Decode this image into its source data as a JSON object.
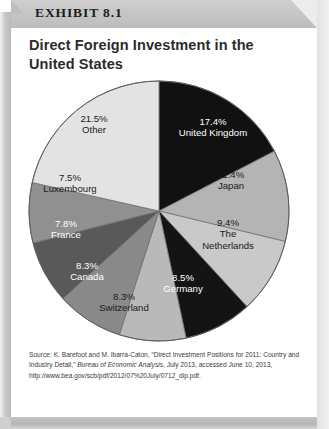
{
  "exhibit": {
    "label": "EXHIBIT 8.1"
  },
  "title": "Direct Foreign Investment in the United States",
  "source": {
    "prefix": "Source: K. Barefoot and M. Ibarra-Caton, “Direct Investment Positions for 2011: Country and Industry Detail,” ",
    "publication": "Bureau of Economic Analysis",
    "suffix": ", July 2013, accessed June 10, 2013, http://www.bea.gov/scb/pdf/2012/07%20July/0712_dip.pdf."
  },
  "colors": {
    "banner": "#c4c4c4",
    "card": "#ffffff",
    "text_dark": "#1a1a1a",
    "text_light": "#ffffff",
    "slice_united_kingdom": "#111111",
    "slice_japan": "#b4b4b4",
    "slice_netherlands": "#c9c9c9",
    "slice_germany": "#141414",
    "slice_switzerland": "#b9b9b9",
    "slice_canada": "#8a8a8a",
    "slice_france": "#595959",
    "slice_luxembourg": "#909090",
    "slice_other": "#e3e3e3"
  },
  "chart_data": {
    "type": "pie",
    "title": "Direct Foreign Investment in the United States",
    "xlabel": "",
    "ylabel": "",
    "legend": "none",
    "start_angle_deg": 0,
    "direction": "clockwise",
    "units": "percent",
    "categories": [
      "United Kingdom",
      "Japan",
      "The Netherlands",
      "Germany",
      "Switzerland",
      "Canada",
      "France",
      "Luxembourg",
      "Other"
    ],
    "values": [
      17.4,
      11.4,
      9.4,
      8.5,
      8.3,
      8.3,
      7.8,
      7.5,
      21.5
    ],
    "slices": [
      {
        "name": "United Kingdom",
        "percent_text": "17.4%",
        "value": 17.4,
        "color": "#111111",
        "text_color": "#ffffff",
        "label_line1": "17.4%",
        "label_line2": "United Kingdom"
      },
      {
        "name": "Japan",
        "percent_text": "11.4%",
        "value": 11.4,
        "color": "#b4b4b4",
        "text_color": "#1a1a1a",
        "label_line1": "11.4%",
        "label_line2": "Japan"
      },
      {
        "name": "The Netherlands",
        "percent_text": "9.4%",
        "value": 9.4,
        "color": "#c9c9c9",
        "text_color": "#1a1a1a",
        "label_line1": "9.4%",
        "label_line2": "The",
        "label_line3": "Netherlands"
      },
      {
        "name": "Germany",
        "percent_text": "8.5%",
        "value": 8.5,
        "color": "#141414",
        "text_color": "#ffffff",
        "label_line1": "8.5%",
        "label_line2": "Germany"
      },
      {
        "name": "Switzerland",
        "percent_text": "8.3%",
        "value": 8.3,
        "color": "#b9b9b9",
        "text_color": "#1a1a1a",
        "label_line1": "8.3%",
        "label_line2": "Switzerland"
      },
      {
        "name": "Canada",
        "percent_text": "8.3%",
        "value": 8.3,
        "color": "#8a8a8a",
        "text_color": "#ffffff",
        "label_line1": "8.3%",
        "label_line2": "Canada"
      },
      {
        "name": "France",
        "percent_text": "7.8%",
        "value": 7.8,
        "color": "#595959",
        "text_color": "#ffffff",
        "label_line1": "7.8%",
        "label_line2": "France"
      },
      {
        "name": "Luxembourg",
        "percent_text": "7.5%",
        "value": 7.5,
        "color": "#909090",
        "text_color": "#1a1a1a",
        "label_line1": "7.5%",
        "label_line2": "Luxembourg"
      },
      {
        "name": "Other",
        "percent_text": "21.5%",
        "value": 21.5,
        "color": "#e3e3e3",
        "text_color": "#1a1a1a",
        "label_line1": "21.5%",
        "label_line2": "Other"
      }
    ]
  }
}
